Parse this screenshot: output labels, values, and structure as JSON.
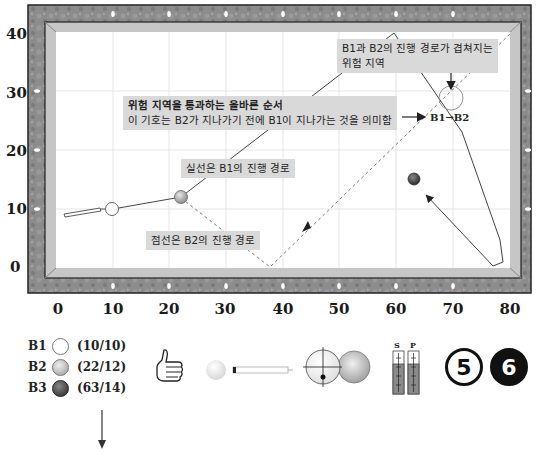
{
  "diagram": {
    "type": "billiards-table-diagram",
    "table": {
      "frame_color": "#8e8e8e",
      "cushion_color": "#c8c8c8",
      "field_color": "#ffffff",
      "grid_color": "#dcdcdc",
      "x_range": [
        0,
        80
      ],
      "y_range": [
        0,
        40
      ]
    },
    "x_axis": {
      "ticks": [
        "0",
        "10",
        "20",
        "30",
        "40",
        "50",
        "60",
        "70",
        "80"
      ]
    },
    "y_axis": {
      "ticks": [
        "40",
        "30",
        "20",
        "10",
        "0"
      ]
    },
    "notes": {
      "danger_zone": [
        "B1과 B2의 진행 경로가 겹쳐지는",
        "위험 지역"
      ],
      "correct_order": [
        "위험 지역을 통과하는 올바른 순서",
        "이 기호는 B2가 지나가기 전에 B1이 지나가는 것을 의미함"
      ],
      "solid_line": "실선은 B1의 진행 경로",
      "dashed_line": "점선은 B2의 진행 경로",
      "order_symbol": "B1→B2"
    },
    "balls": [
      {
        "key": "B1",
        "coord": "(10/10)",
        "x": 10,
        "y": 10,
        "color": "#ffffff"
      },
      {
        "key": "B2",
        "coord": "(22/12)",
        "x": 22,
        "y": 12,
        "color": "#b8b8b8"
      },
      {
        "key": "B3",
        "coord": "(63/14)",
        "x": 63,
        "y": 14,
        "color": "#555555"
      }
    ],
    "b1_path": [
      [
        10,
        10
      ],
      [
        22,
        12
      ],
      [
        60,
        40
      ],
      [
        82,
        3
      ],
      [
        78,
        0
      ],
      [
        63,
        14
      ]
    ],
    "b2_path": [
      [
        22,
        12
      ],
      [
        38,
        0
      ],
      [
        80,
        40
      ]
    ],
    "danger_circle": {
      "x": 70,
      "y": 30
    }
  },
  "legend": {
    "items": [
      {
        "key": "B1",
        "coord": "(10/10)"
      },
      {
        "key": "B2",
        "coord": "(22/12)"
      },
      {
        "key": "B3",
        "coord": "(63/14)"
      }
    ],
    "icons": [
      "thumbs-up-icon",
      "cue-ball-with-cue-icon",
      "ball-contact-icon",
      "spin-power-gauge-icon",
      "ball-5-icon",
      "ball-6-icon"
    ],
    "gauge_labels": {
      "s": "S",
      "p": "P"
    },
    "ball_numbers": {
      "five": "5",
      "six": "6"
    }
  }
}
